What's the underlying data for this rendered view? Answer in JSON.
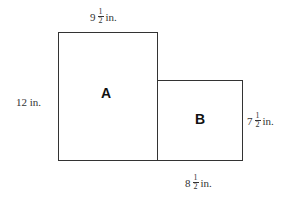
{
  "diagram": {
    "shapes": [
      {
        "label": "A",
        "type": "rectangle"
      },
      {
        "label": "B",
        "type": "rectangle"
      }
    ],
    "dimensions": {
      "a_width": {
        "whole": "9",
        "num": "1",
        "den": "2",
        "unit": "in."
      },
      "a_height": {
        "text": "12 in."
      },
      "b_height": {
        "whole": "7",
        "num": "1",
        "den": "2",
        "unit": "in."
      },
      "b_width": {
        "whole": "8",
        "num": "1",
        "den": "2",
        "unit": "in."
      }
    }
  }
}
